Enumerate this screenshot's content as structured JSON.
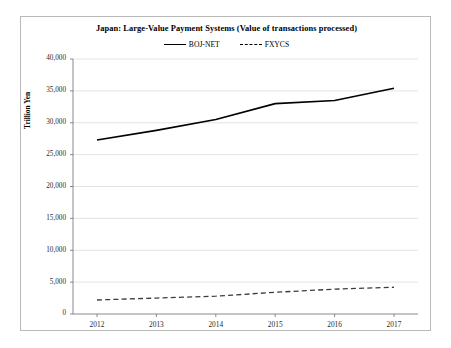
{
  "chart_data": {
    "type": "line",
    "title": "Japan: Large-Value Payment Systems (Value of transactions processed)",
    "xlabel": "",
    "ylabel": "Trillion Yen",
    "x": [
      "2012",
      "2013",
      "2014",
      "2015",
      "2016",
      "2017"
    ],
    "categories": [
      "2012",
      "2013",
      "2014",
      "2015",
      "2016",
      "2017"
    ],
    "series": [
      {
        "name": "BOJ-NET",
        "style": "solid",
        "color": "#000000",
        "values": [
          27300,
          28800,
          30500,
          33000,
          33500,
          35400
        ]
      },
      {
        "name": "FXYCS",
        "style": "dashed",
        "color": "#3c3c3c",
        "values": [
          2200,
          2500,
          2800,
          3400,
          3900,
          4200
        ]
      }
    ],
    "ylim": [
      0,
      40000
    ],
    "yticks": [
      0,
      5000,
      10000,
      15000,
      20000,
      25000,
      30000,
      35000,
      40000
    ],
    "ytick_labels": [
      "0",
      "5,000",
      "10,000",
      "15,000",
      "20,000",
      "25,000",
      "30,000",
      "35,000",
      "40,000"
    ],
    "grid": true,
    "grid_axis": "y",
    "legend_position": "top-center"
  },
  "legend": {
    "entries": [
      {
        "label": "BOJ-NET",
        "style": "solid"
      },
      {
        "label": "FXYCS",
        "style": "dashed"
      }
    ]
  }
}
